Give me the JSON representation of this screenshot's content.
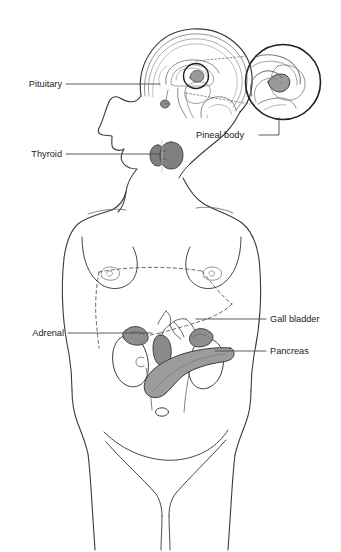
{
  "figure": {
    "background_color": "#ffffff",
    "line_color": "#2b2b2b"
  },
  "labels": [
    {
      "id": "pituitary",
      "text": "Pituitary",
      "side": "left",
      "text_x": 62,
      "text_y": 87,
      "leader": "M 66 84 L 160 84",
      "organ": "pituitary-gland"
    },
    {
      "id": "thyroid",
      "text": "Thyroid",
      "side": "left",
      "text_x": 62,
      "text_y": 157,
      "leader": "M 66 154 L 160 154",
      "organ": "thyroid-gland"
    },
    {
      "id": "adrenal",
      "text": "Adrenal",
      "side": "left",
      "text_x": 64,
      "text_y": 336,
      "leader": "M 68 333 L 152 333",
      "organ": "adrenal-gland"
    },
    {
      "id": "pineal-body",
      "text": "Pineal body",
      "side": "right",
      "text_x": 196,
      "text_y": 138,
      "leader": "M 259 135 L 279 135 L 279 118",
      "organ": "pineal-body"
    },
    {
      "id": "gall-bladder",
      "text": "Gall bladder",
      "side": "right",
      "text_x": 270,
      "text_y": 322,
      "leader": "M 266 319 L 196 319",
      "organ": "gall-bladder"
    },
    {
      "id": "pancreas",
      "text": "Pancreas",
      "side": "right",
      "text_x": 270,
      "text_y": 354,
      "leader": "M 266 351 L 215 351",
      "organ": "pancreas"
    }
  ],
  "organs": {
    "pituitary-gland": {
      "name": "Pituitary",
      "fill": "#8c8c8c"
    },
    "pineal-body": {
      "name": "Pineal body",
      "fill": "#9a9a9a"
    },
    "thyroid-gland": {
      "name": "Thyroid",
      "fill": "#7f7f7f"
    },
    "adrenal-gland": {
      "name": "Adrenal",
      "fill": "#8e8e8e"
    },
    "kidney": {
      "name": "Kidney",
      "fill": "#ffffff"
    },
    "gall-bladder": {
      "name": "Gall bladder",
      "fill": "#8a8a8a"
    },
    "pancreas": {
      "name": "Pancreas",
      "fill": "#9c9c9c"
    }
  },
  "inset": {
    "name": "pineal-body-magnification",
    "center_x": 283,
    "center_y": 82,
    "radius": 38,
    "connector_upper": "M 196 61 L 248 56",
    "connector_lower": "M 186 93 L 250 104"
  }
}
